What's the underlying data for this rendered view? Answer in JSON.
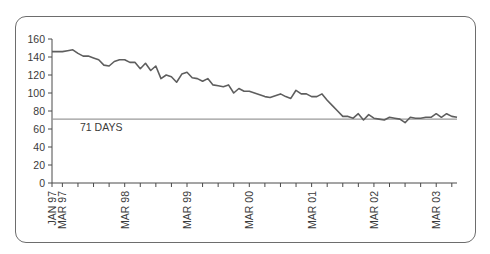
{
  "chart_data": {
    "type": "line",
    "title": "",
    "xlabel": "",
    "ylabel": "",
    "ylim": [
      0,
      160
    ],
    "yticks": [
      0,
      20,
      40,
      60,
      80,
      100,
      120,
      140,
      160
    ],
    "xtick_labels": [
      "JAN 97",
      "MAR 97",
      "MAR 98",
      "MAR 99",
      "MAR 00",
      "MAR 01",
      "MAR 02",
      "MAR 03"
    ],
    "x_start": "JAN 97",
    "x_end": "MAR 03",
    "x_interval": "monthly",
    "grid": false,
    "legend": null,
    "series": [
      {
        "name": "Days",
        "values": [
          146,
          146,
          146,
          147,
          148,
          144,
          141,
          141,
          139,
          137,
          131,
          130,
          135,
          137,
          137,
          134,
          134,
          127,
          133,
          125,
          130,
          116,
          120,
          118,
          112,
          121,
          123,
          117,
          116,
          113,
          116,
          109,
          108,
          107,
          109,
          100,
          105,
          102,
          102,
          100,
          98,
          96,
          95,
          97,
          99,
          96,
          94,
          103,
          99,
          99,
          96,
          96,
          99,
          92,
          86,
          80,
          74,
          74,
          72,
          77,
          70,
          76,
          72,
          71,
          70,
          73,
          72,
          71,
          67,
          73,
          72,
          72,
          73,
          73,
          77,
          73,
          77,
          74,
          73
        ]
      }
    ],
    "reference_lines": [
      {
        "value": 71,
        "label": "71 DAYS"
      }
    ]
  },
  "axis": {
    "y_labels": [
      "160",
      "140",
      "120",
      "100",
      "80",
      "60",
      "40",
      "20",
      "0"
    ],
    "x_labels": [
      "JAN 97",
      "MAR 97",
      "MAR 98",
      "MAR 99",
      "MAR 00",
      "MAR 01",
      "MAR 02",
      "MAR 03"
    ]
  },
  "reference": {
    "label": "71 DAYS"
  },
  "colors": {
    "line": "#5e5e5e",
    "reference": "#9a9a9a",
    "axis": "#4a4a4a",
    "frame": "#6d6d6d"
  }
}
